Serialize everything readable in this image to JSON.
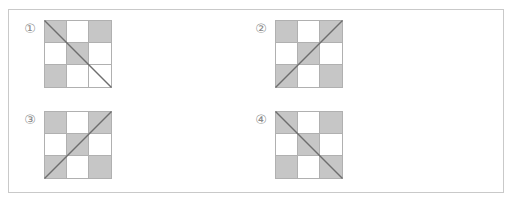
{
  "figure": {
    "background_color": "#ffffff",
    "frame_color": "#c9c9c9",
    "shaded_color": "#c6c6c6",
    "cell_line_color": "#b0b0b0",
    "diagonal_color": "#6e6e6e",
    "grid_rows": 3,
    "grid_cols": 3
  },
  "puzzles": [
    {
      "label": "①",
      "label_text": "1",
      "diagonal": "main",
      "diagonal_desc": "top-left to bottom-right",
      "cells": [
        [
          "shaded",
          "white",
          "shaded"
        ],
        [
          "white",
          "shaded",
          "white"
        ],
        [
          "shaded",
          "white",
          "white"
        ]
      ]
    },
    {
      "label": "②",
      "label_text": "2",
      "diagonal": "anti",
      "diagonal_desc": "bottom-left to top-right",
      "cells": [
        [
          "shaded",
          "white",
          "shaded"
        ],
        [
          "white",
          "shaded",
          "white"
        ],
        [
          "shaded",
          "white",
          "shaded"
        ]
      ]
    },
    {
      "label": "③",
      "label_text": "3",
      "diagonal": "anti",
      "diagonal_desc": "bottom-left to top-right",
      "cells": [
        [
          "shaded",
          "white",
          "shaded"
        ],
        [
          "white",
          "shaded",
          "white"
        ],
        [
          "shaded",
          "white",
          "shaded"
        ]
      ]
    },
    {
      "label": "④",
      "label_text": "4",
      "diagonal": "main",
      "diagonal_desc": "top-left to bottom-right",
      "cells": [
        [
          "shaded",
          "white",
          "shaded"
        ],
        [
          "white",
          "shaded",
          "white"
        ],
        [
          "shaded",
          "white",
          "shaded"
        ]
      ]
    }
  ]
}
